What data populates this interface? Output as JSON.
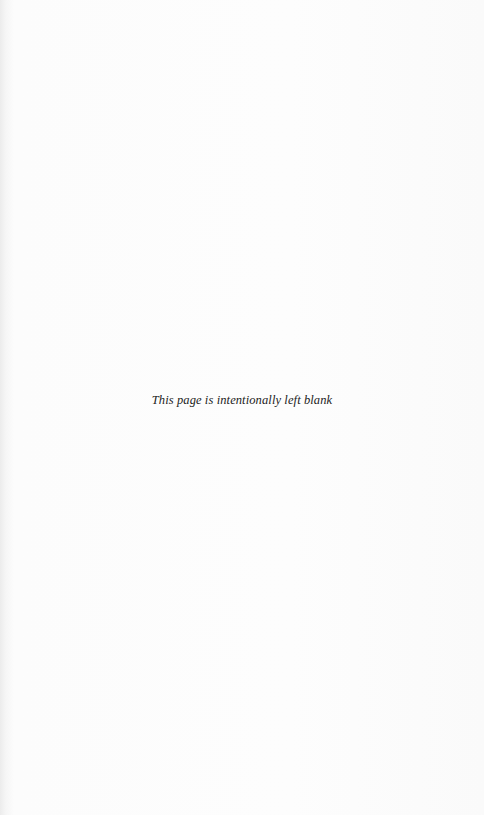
{
  "page": {
    "notice": "This page is intentionally left blank",
    "background_color": "#fcfcfc",
    "text_color": "#222222"
  }
}
